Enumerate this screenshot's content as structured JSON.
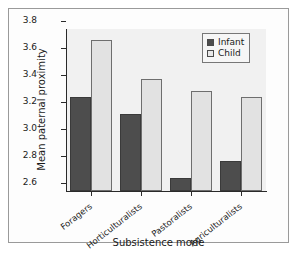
{
  "chart_data": {
    "type": "bar",
    "title": "",
    "subtitle": "",
    "xlabel": "Subsistence mode",
    "ylabel": "Mean paternal proximity",
    "categories": [
      "Foragers",
      "Horticulturalists",
      "Pastoralists",
      "Agriculturalists"
    ],
    "series": [
      {
        "name": "Infant",
        "values": [
          3.3,
          3.17,
          2.7,
          2.82
        ],
        "color": "#4d4d4d"
      },
      {
        "name": "Child",
        "values": [
          3.72,
          3.43,
          3.34,
          3.3
        ],
        "color": "#e2e2e2"
      }
    ],
    "ylim": [
      2.6,
      3.8
    ],
    "y_ticks": [
      "2.6",
      "2.8",
      "3.0",
      "3.2",
      "3.4",
      "3.6",
      "3.8"
    ],
    "y_tick_values": [
      2.6,
      2.8,
      3.0,
      3.2,
      3.4,
      3.6,
      3.8
    ],
    "grid": false,
    "legend_position": "top-right",
    "legend_entries": [
      "Infant",
      "Child"
    ]
  },
  "axes": {
    "y_title": "Mean paternal proximity",
    "x_title": "Subsistence mode",
    "y_tick_labels": [
      "2.6",
      "2.8",
      "3.0",
      "3.2",
      "3.4",
      "3.6",
      "3.8"
    ],
    "x_tick_labels": [
      "Foragers",
      "Horticulturalists",
      "Pastoralists",
      "Agriculturalists"
    ]
  },
  "legend": {
    "items": [
      {
        "label": "Infant"
      },
      {
        "label": "Child"
      }
    ]
  },
  "colors": {
    "infant_bar": "#4d4d4d",
    "child_bar": "#e2e2e2",
    "panel_background": "#f1f1f1",
    "figure_background": "#fdfdfd",
    "frame_border": "#9a9a9a",
    "axis": "#2a2a2a",
    "text": "#1a1a1a"
  }
}
